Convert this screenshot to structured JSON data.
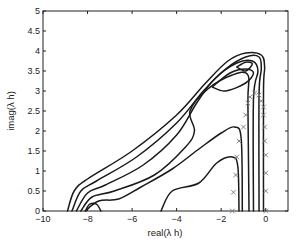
{
  "chart_data": {
    "type": "line",
    "subtype": "contour_with_markers",
    "title": "",
    "xlabel": "real(λ h)",
    "ylabel": "imag(λ h)",
    "xlim": [
      -10,
      1
    ],
    "ylim": [
      0,
      5
    ],
    "xticks": [
      -10,
      -8,
      -6,
      -4,
      -2,
      0
    ],
    "xtick_labels": [
      "−10",
      "−8",
      "−6",
      "−4",
      "−2",
      "0"
    ],
    "yticks": [
      0,
      0.5,
      1,
      1.5,
      2,
      2.5,
      3,
      3.5,
      4,
      4.5,
      5
    ],
    "ytick_labels": [
      "0",
      "0.5",
      "1",
      "1.5",
      "2",
      "2.5",
      "3",
      "3.5",
      "4",
      "4.5",
      "5"
    ],
    "grid": false,
    "legend": null,
    "contour_levels_count": 8,
    "contours": [
      {
        "name": "outer-1",
        "points": [
          [
            -8.9,
            0
          ],
          [
            -8.6,
            0.5
          ],
          [
            -8.0,
            0.8
          ],
          [
            -6.0,
            1.5
          ],
          [
            -4.0,
            2.4
          ],
          [
            -2.7,
            3.2
          ],
          [
            -1.7,
            3.75
          ],
          [
            -0.9,
            3.95
          ],
          [
            -0.2,
            3.9
          ],
          [
            -0.05,
            3.6
          ],
          [
            -0.1,
            3.0
          ],
          [
            -0.1,
            0
          ]
        ]
      },
      {
        "name": "outer-2",
        "points": [
          [
            -8.7,
            0
          ],
          [
            -8.3,
            0.5
          ],
          [
            -7.6,
            0.75
          ],
          [
            -5.8,
            1.35
          ],
          [
            -4.0,
            2.2
          ],
          [
            -2.8,
            3.0
          ],
          [
            -1.8,
            3.55
          ],
          [
            -0.9,
            3.85
          ],
          [
            -0.3,
            3.85
          ],
          [
            -0.2,
            3.55
          ],
          [
            -0.3,
            2.9
          ],
          [
            -0.3,
            0
          ]
        ]
      },
      {
        "name": "outer-3",
        "points": [
          [
            -8.5,
            0
          ],
          [
            -8.0,
            0.45
          ],
          [
            -7.2,
            0.65
          ],
          [
            -5.5,
            1.15
          ],
          [
            -4.0,
            1.9
          ],
          [
            -3.1,
            2.7
          ],
          [
            -2.3,
            3.3
          ],
          [
            -1.3,
            3.7
          ],
          [
            -0.6,
            3.75
          ],
          [
            -0.35,
            3.5
          ],
          [
            -0.55,
            2.8
          ],
          [
            -0.55,
            0
          ]
        ]
      },
      {
        "name": "outer-4",
        "points": [
          [
            -8.3,
            0
          ],
          [
            -7.8,
            0.35
          ],
          [
            -6.8,
            0.5
          ],
          [
            -5.0,
            0.9
          ],
          [
            -3.6,
            1.6
          ],
          [
            -3.2,
            2.0
          ],
          [
            -3.4,
            2.5
          ],
          [
            -2.6,
            3.05
          ],
          [
            -1.5,
            3.4
          ],
          [
            -0.8,
            3.4
          ],
          [
            -0.8,
            2.7
          ],
          [
            -0.75,
            0
          ]
        ]
      },
      {
        "name": "outer-5",
        "points": [
          [
            -8.1,
            0
          ],
          [
            -7.5,
            0.25
          ],
          [
            -6.6,
            0.3
          ],
          [
            -5.6,
            0.6
          ],
          [
            -4.2,
            1.05
          ],
          [
            -3.0,
            1.55
          ],
          [
            -2.0,
            1.95
          ],
          [
            -1.4,
            2.1
          ],
          [
            -1.1,
            1.8
          ],
          [
            -1.05,
            0
          ]
        ]
      },
      {
        "name": "inner-bump",
        "points": [
          [
            -4.7,
            0
          ],
          [
            -4.2,
            0.5
          ],
          [
            -3.0,
            0.7
          ],
          [
            -2.2,
            1.2
          ],
          [
            -1.5,
            1.35
          ],
          [
            -1.25,
            1.1
          ],
          [
            -1.2,
            0
          ]
        ]
      },
      {
        "name": "small-loop",
        "points": [
          [
            -8.1,
            0
          ],
          [
            -7.9,
            0.17
          ],
          [
            -7.6,
            0.17
          ],
          [
            -7.4,
            0
          ]
        ]
      },
      {
        "name": "peak-loop-1",
        "points": [
          [
            -2.4,
            3.1
          ],
          [
            -1.6,
            3.45
          ],
          [
            -0.9,
            3.55
          ],
          [
            -0.55,
            3.45
          ],
          [
            -0.9,
            3.2
          ],
          [
            -1.8,
            3.0
          ],
          [
            -2.4,
            3.1
          ]
        ]
      },
      {
        "name": "peak-loop-2",
        "points": [
          [
            -1.3,
            3.6
          ],
          [
            -0.9,
            3.72
          ],
          [
            -0.6,
            3.68
          ],
          [
            -0.9,
            3.5
          ],
          [
            -1.3,
            3.6
          ]
        ]
      }
    ],
    "markers": {
      "symbol": "x",
      "color": "#777777",
      "points": [
        [
          -1.5,
          0
        ],
        [
          -1.45,
          0.47
        ],
        [
          -1.35,
          0.9
        ],
        [
          -1.3,
          1.35
        ],
        [
          -1.2,
          1.75
        ],
        [
          -1.0,
          2.1
        ],
        [
          -0.9,
          2.4
        ],
        [
          -0.8,
          2.7
        ],
        [
          -0.7,
          2.85
        ],
        [
          -0.5,
          2.95
        ],
        [
          -0.3,
          2.9
        ],
        [
          -0.2,
          2.75
        ],
        [
          -0.1,
          2.6
        ],
        [
          -0.1,
          2.4
        ],
        [
          -0.05,
          2.1
        ],
        [
          -0.05,
          1.75
        ],
        [
          0,
          1.4
        ],
        [
          0,
          0.95
        ],
        [
          0,
          0.5
        ],
        [
          0,
          0
        ]
      ]
    },
    "colors": {
      "contour": "#1a1a1a",
      "marker": "#777777",
      "axes": "#222222"
    }
  }
}
